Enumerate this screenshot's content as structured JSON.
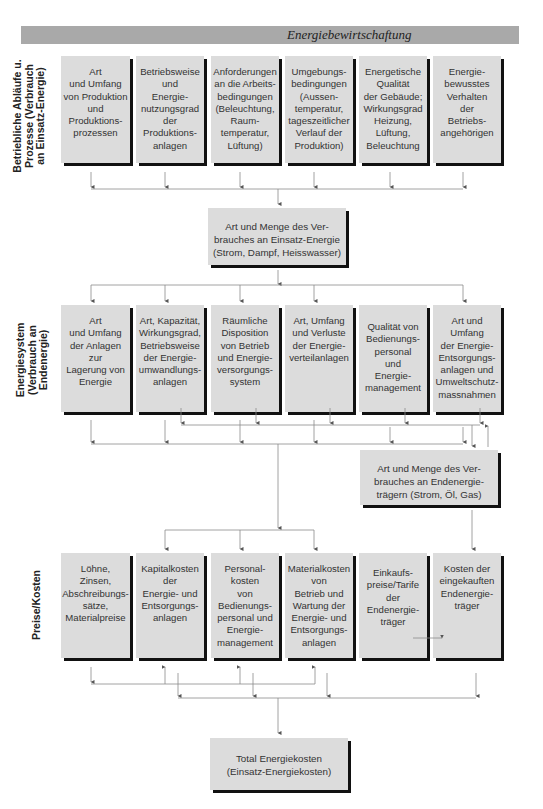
{
  "header": {
    "title": "Energiebewirtschaftung",
    "bar_color": "#a9a9a9"
  },
  "colors": {
    "box_fill": "#dcdcdc",
    "shadow": "#111111",
    "line": "#888888"
  },
  "sections": [
    {
      "label": "Betriebliche Abläufe u.\nProzesse (Verbrauch\nan Einsatz-Energie)",
      "boxes": [
        "Art\nund Umfang\nvon Produktion\nund\nProduktions-\nprozessen",
        "Betriebsweise\nund\nEnergie-\nnutzungsgrad\nder\nProduktions-\nanlagen",
        "Anforderungen\nan die Arbeits-\nbedingungen\n(Beleuchtung,\nRaum-\ntemperatur,\nLüftung)",
        "Umgebungs-\nbedingungen\n(Aussen-\ntemperatur,\ntageszeitlicher\nVerlauf der\nProduktion)",
        "Energetische\nQualität\nder Gebäude;\nWirkungsgrad\nHeizung,\nLüftung,\nBeleuchtung",
        "Energie-\nbewusstes\nVerhalten\nder\nBetriebs-\nangehörigen"
      ]
    },
    {
      "label": "Energiesystem\n(Verbrauch an\nEndenergie)",
      "boxes": [
        "Art\nund Umfang\nder Anlagen\nzur\nLagerung von\nEnergie",
        "Art, Kapazität,\nWirkungsgrad,\nBetriebsweise\nder Energie-\numwandlungs-\nanlagen",
        "Räumliche\nDisposition\nvon Betrieb\nund Energie-\nversorgungs-\nsystem",
        "Art, Umfang\nund Verluste\nder Energie-\nverteilanlagen",
        "Qualität von\nBedienungs-\npersonal\nund\nEnergie-\nmanagement",
        "Art und\nUmfang\nder Energie-\nEntsorgungs-\nanlagen und\nUmweltschutz-\nmassnahmen"
      ]
    },
    {
      "label": "Preise/Kosten",
      "boxes": [
        "Löhne,\nZinsen,\nAbschreibungs-\nsätze,\nMaterialpreise",
        "Kapitalkosten\nder\nEnergie- und\nEntsorgungs-\nanlagen",
        "Personal-\nkosten\nvon\nBedienungs-\npersonal und\nEnergie-\nmanagement",
        "Materialkosten\nvon\nBetrieb und\nWartung der\nEnergie- und\nEntsorgungs-\nanlagen",
        "Einkaufs-\npreise/Tarife\nder\nEndenergie-\nträger",
        "Kosten der\neingekauften\nEndenergie-\nträger"
      ]
    }
  ],
  "summary_boxes": {
    "einsatz": "Art und Menge des Ver-\nbrauches an Einsatz-Energie\n(Strom, Dampf, Heisswasser)",
    "endenergie": "Art und Menge des Ver-\nbrauches an Endenergie-\nträgern (Strom, Öl, Gas)",
    "total": "Total Energiekosten\n(Einsatz-Energiekosten)"
  }
}
